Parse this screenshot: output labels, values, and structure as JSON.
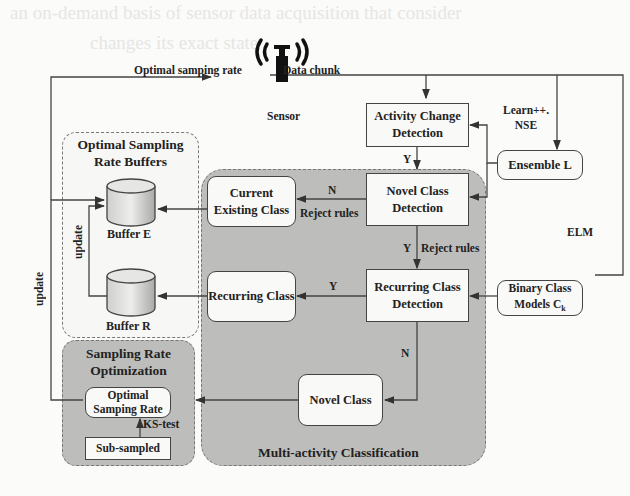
{
  "diagram": {
    "sensor": {
      "label": "Sensor",
      "icon": "antenna-sensor-icon"
    },
    "edges": {
      "optimal_sampling_rate": "Optimal samping rate",
      "data_chunk": "Data chunk",
      "learn_nse": "Learn++.\nNSE",
      "elm": "ELM",
      "y_activity": "Y",
      "n_novel": "N",
      "reject_rules_1": "Reject rules",
      "y_novel": "Y",
      "reject_rules_2": "Reject rules",
      "y_recurring": "Y",
      "n_recurring": "N",
      "update_inner": "update",
      "update_outer": "update",
      "ks_test": "KS-test"
    },
    "nodes": {
      "activity_change_detection": "Activity Change Detection",
      "ensemble_l": "Ensemble L",
      "novel_class_detection": "Novel Class Detection",
      "current_existing_class": "Current Existing Class",
      "recurring_class_detection": "Recurring Class Detection",
      "recurring_class": "Recurring Class",
      "binary_class_models": "Binary Class Models C",
      "binary_class_models_sub": "k",
      "novel_class": "Novel Class",
      "optimal_samping_rate": "Optimal Samping Rate",
      "sub_sampled": "Sub-sampled"
    },
    "regions": {
      "buffers_title": "Optimal Sampling Rate Buffers",
      "buffer_e": "Buffer E",
      "buffer_r": "Buffer R",
      "sampling_title": "Sampling Rate Optimization",
      "multi_activity_title": "Multi-activity Classification"
    },
    "colors": {
      "region_fill": "#bdbdbb",
      "box_fill": "#f9f9f7",
      "line": "#444444"
    }
  }
}
